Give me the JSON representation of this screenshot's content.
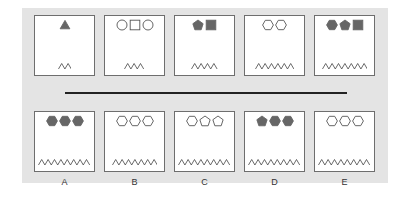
{
  "colors": {
    "panel_bg": "#e4e4e4",
    "box_border": "#6e6e6e",
    "shape_fill": "#666666",
    "shape_stroke": "#555555",
    "divider": "#222222"
  },
  "sequence": [
    {
      "shapes": [
        {
          "type": "triangle",
          "filled": true
        }
      ],
      "zigzag_peaks": 2
    },
    {
      "shapes": [
        {
          "type": "circle",
          "filled": false
        },
        {
          "type": "square",
          "filled": false
        },
        {
          "type": "circle",
          "filled": false
        }
      ],
      "zigzag_peaks": 3
    },
    {
      "shapes": [
        {
          "type": "pentagon",
          "filled": true
        },
        {
          "type": "square",
          "filled": true
        }
      ],
      "zigzag_peaks": 4
    },
    {
      "shapes": [
        {
          "type": "hexagon",
          "filled": false
        },
        {
          "type": "hexagon",
          "filled": false
        }
      ],
      "zigzag_peaks": 6
    },
    {
      "shapes": [
        {
          "type": "hexagon",
          "filled": true
        },
        {
          "type": "pentagon",
          "filled": true
        },
        {
          "type": "square",
          "filled": true
        }
      ],
      "zigzag_peaks": 7
    }
  ],
  "options": [
    {
      "label": "A",
      "shapes": [
        {
          "type": "hexagon",
          "filled": true
        },
        {
          "type": "hexagon",
          "filled": true
        },
        {
          "type": "hexagon",
          "filled": true
        }
      ],
      "zigzag_peaks": 8
    },
    {
      "label": "B",
      "shapes": [
        {
          "type": "hexagon",
          "filled": false
        },
        {
          "type": "hexagon",
          "filled": false
        },
        {
          "type": "hexagon",
          "filled": false
        }
      ],
      "zigzag_peaks": 7
    },
    {
      "label": "C",
      "shapes": [
        {
          "type": "hexagon",
          "filled": false
        },
        {
          "type": "pentagon",
          "filled": false
        },
        {
          "type": "pentagon",
          "filled": false
        }
      ],
      "zigzag_peaks": 8
    },
    {
      "label": "D",
      "shapes": [
        {
          "type": "pentagon",
          "filled": true
        },
        {
          "type": "hexagon",
          "filled": true
        },
        {
          "type": "hexagon",
          "filled": true
        }
      ],
      "zigzag_peaks": 8
    },
    {
      "label": "E",
      "shapes": [
        {
          "type": "hexagon",
          "filled": false
        },
        {
          "type": "hexagon",
          "filled": false
        },
        {
          "type": "hexagon",
          "filled": false
        }
      ],
      "zigzag_peaks": 8
    }
  ]
}
